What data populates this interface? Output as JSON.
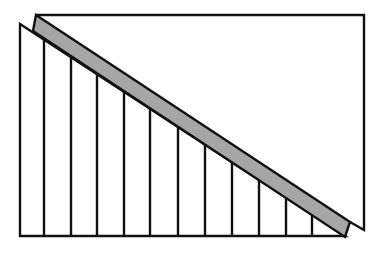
{
  "figure": {
    "colors": {
      "background": "#ffffff",
      "stroke": "#111111",
      "strip_fill": "#a6a6a6"
    },
    "stroke_width": 2.4,
    "upper_shape": {
      "points": [
        [
          36,
          15
        ],
        [
          364,
          15
        ],
        [
          364,
          230
        ],
        [
          350,
          222
        ]
      ]
    },
    "strip": {
      "points": [
        [
          36,
          15
        ],
        [
          350,
          222
        ],
        [
          345,
          237
        ],
        [
          33,
          31
        ]
      ]
    },
    "left_triangle": {
      "points": [
        [
          20,
          24
        ],
        [
          20,
          236
        ],
        [
          345,
          236
        ]
      ],
      "hypotenuse": {
        "x1": 20,
        "y1": 24,
        "x2": 345,
        "y2": 236
      }
    },
    "slat_x_positions": [
      44,
      71,
      97,
      124,
      150,
      178,
      205,
      232,
      259,
      286,
      312
    ],
    "baseline_y": 236
  }
}
